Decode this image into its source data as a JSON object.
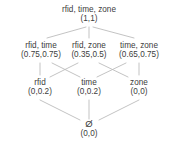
{
  "diagram": {
    "type": "hasse-lattice",
    "background_color": "#ffffff",
    "text_color": "#3d3d3d",
    "edge_color": "#b9b9b9",
    "levels": [
      {
        "index": 0,
        "nodes": [
          {
            "id": "rfid-time-zone",
            "label": "rfid, time, zone",
            "value": "(1,1)"
          }
        ]
      },
      {
        "index": 1,
        "nodes": [
          {
            "id": "rfid-time",
            "label": "rfid, time",
            "value": "(0.75,0.75)"
          },
          {
            "id": "rfid-zone",
            "label": "rfid, zone",
            "value": "(0.35,0.5)"
          },
          {
            "id": "time-zone",
            "label": "time, zone",
            "value": "(0.65,0.75)"
          }
        ]
      },
      {
        "index": 2,
        "nodes": [
          {
            "id": "rfid",
            "label": "rfid",
            "value": "(0,0.2)"
          },
          {
            "id": "time",
            "label": "time",
            "value": "(0,0.2)"
          },
          {
            "id": "zone",
            "label": "zone",
            "value": "(0,0)"
          }
        ]
      },
      {
        "index": 3,
        "nodes": [
          {
            "id": "empty-set",
            "label": "Ø",
            "value": "(0,0)"
          }
        ]
      }
    ],
    "edges": [
      {
        "from": "rfid-time-zone",
        "to": "rfid-time"
      },
      {
        "from": "rfid-time-zone",
        "to": "rfid-zone"
      },
      {
        "from": "rfid-time-zone",
        "to": "time-zone"
      },
      {
        "from": "rfid-time",
        "to": "rfid"
      },
      {
        "from": "rfid-time",
        "to": "time"
      },
      {
        "from": "rfid-zone",
        "to": "rfid"
      },
      {
        "from": "rfid-zone",
        "to": "zone"
      },
      {
        "from": "time-zone",
        "to": "time"
      },
      {
        "from": "time-zone",
        "to": "zone"
      },
      {
        "from": "rfid",
        "to": "empty-set"
      },
      {
        "from": "time",
        "to": "empty-set"
      },
      {
        "from": "zone",
        "to": "empty-set"
      }
    ]
  }
}
